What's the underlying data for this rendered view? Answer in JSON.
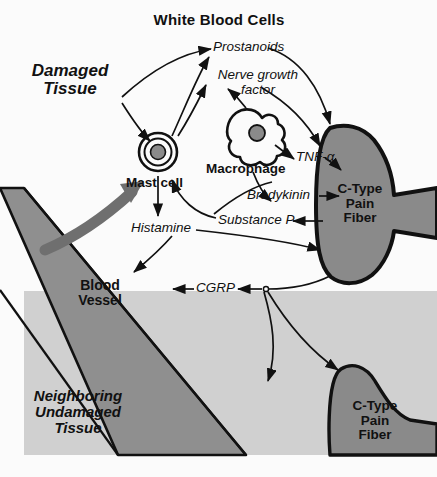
{
  "figure": {
    "title": "White Blood Cells",
    "type": "biomedical-pathway-diagram",
    "background_color": "#fbfbfb"
  },
  "palette": {
    "tissue_damaged_bg": "#fbfbfb",
    "tissue_undamaged_bg": "#d0d0d0",
    "blood_vessel_fill": "#8f8f8f",
    "nerve_fiber_fill": "#8a8a8a",
    "cell_nucleus_fill": "#8a8a8a",
    "thick_arrow_fill": "#6f6f6f",
    "stroke": "#111111"
  },
  "labels": {
    "title": "White Blood Cells",
    "damaged_tissue": "Damaged\nTissue",
    "mast_cell": "Mast cell",
    "macrophage": "Macrophage",
    "prostanoids": "Prostanoids",
    "nerve_growth_factor": "Nerve growth\nfactor",
    "tnf_alpha": "TNF-α",
    "bradykinin": "Bradykinin",
    "substance_p": "Substance P",
    "histamine": "Histamine",
    "cgrp": "CGRP",
    "blood_vessel": "Blood\nVessel",
    "neighboring_tissue": "Neighboring\nUndamaged\nTissue",
    "c_fiber_upper": "C-Type\nPain\nFiber",
    "c_fiber_lower": "C-Type\nPain\nFiber"
  },
  "mediators": [
    {
      "name": "Prostanoids",
      "style": "italic"
    },
    {
      "name": "Nerve growth factor",
      "style": "italic"
    },
    {
      "name": "TNF-α",
      "style": "italic"
    },
    {
      "name": "Bradykinin",
      "style": "italic"
    },
    {
      "name": "Substance P",
      "style": "italic"
    },
    {
      "name": "Histamine",
      "style": "italic"
    },
    {
      "name": "CGRP",
      "style": "italic"
    }
  ],
  "structures": [
    {
      "name": "Mast cell",
      "style": "bold"
    },
    {
      "name": "Macrophage",
      "style": "bold"
    },
    {
      "name": "Blood Vessel",
      "style": "bold"
    },
    {
      "name": "C-Type Pain Fiber",
      "style": "bold",
      "count": 2
    },
    {
      "name": "Damaged Tissue",
      "style": "bold-italic"
    },
    {
      "name": "Neighboring Undamaged Tissue",
      "style": "bold-italic"
    }
  ],
  "pathways": [
    {
      "from": "Damaged Tissue",
      "to": "Prostanoids"
    },
    {
      "from": "Damaged Tissue",
      "to": "Mast cell"
    },
    {
      "from": "Mast cell",
      "to": "Prostanoids"
    },
    {
      "from": "Mast cell",
      "to": "Nerve growth factor"
    },
    {
      "from": "Mast cell",
      "to": "Histamine"
    },
    {
      "from": "Macrophage",
      "to": "Nerve growth factor"
    },
    {
      "from": "Macrophage",
      "to": "TNF-α"
    },
    {
      "from": "Macrophage",
      "to": "Bradykinin"
    },
    {
      "from": "Prostanoids",
      "to": "C-Type Pain Fiber"
    },
    {
      "from": "Nerve growth factor",
      "to": "C-Type Pain Fiber"
    },
    {
      "from": "TNF-α",
      "to": "C-Type Pain Fiber"
    },
    {
      "from": "Bradykinin",
      "to": "C-Type Pain Fiber"
    },
    {
      "from": "C-Type Pain Fiber",
      "to": "Substance P"
    },
    {
      "from": "Substance P",
      "to": "Mast cell"
    },
    {
      "from": "Histamine",
      "to": "C-Type Pain Fiber"
    },
    {
      "from": "Histamine",
      "to": "Blood Vessel"
    },
    {
      "from": "C-Type Pain Fiber",
      "to": "CGRP"
    },
    {
      "from": "CGRP",
      "to": "Blood Vessel"
    },
    {
      "from": "Blood Vessel",
      "to": "Mast cell"
    },
    {
      "from": "C-Type Pain Fiber",
      "to": "Neighboring Undamaged Tissue"
    }
  ]
}
